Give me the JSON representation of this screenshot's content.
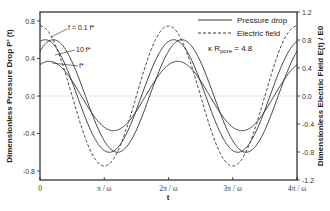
{
  "chart_data": {
    "type": "line",
    "title": "",
    "xlabel": "t",
    "ylabel": "Dimensionless Pressure Drop P' (t)",
    "y2label": "Dimensionless Electric Field E(t) / E0",
    "x_ticks": [
      "0",
      "π / ω",
      "2π / ω",
      "3π / ω",
      "4π / ω"
    ],
    "xlim": [
      0,
      4
    ],
    "x_unit": "π/ω",
    "ylim": [
      -0.9,
      0.9
    ],
    "y_ticks": [
      "0.8",
      "0.4",
      "0.0",
      "-0.4",
      "-0.8"
    ],
    "y2lim": [
      -1.2,
      1.2
    ],
    "y2_ticks": [
      "1.2",
      "0.8",
      "0.4",
      "0.0",
      "-0.4",
      "-0.8",
      "-1.2"
    ],
    "grid": false,
    "zero_line": "dotted",
    "legend_position": "upper right",
    "legend": [
      {
        "label": "Pressure drop",
        "style": "solid"
      },
      {
        "label": "Electric field",
        "style": "dashed"
      }
    ],
    "annotation_param": "κ Rpore = 4.8",
    "series": [
      {
        "name": "f = 0.1 f*",
        "axis": "left",
        "style": "solid",
        "amplitude": 0.6,
        "phase_lag_rad": 0.25,
        "x": [
          0,
          0.5,
          1,
          1.5,
          2,
          2.5,
          3,
          3.5,
          4
        ],
        "values": [
          0.58,
          -0.15,
          -0.58,
          0.15,
          0.58,
          -0.15,
          -0.58,
          0.15,
          0.58
        ]
      },
      {
        "name": "10 f*",
        "axis": "left",
        "style": "solid",
        "amplitude": 0.6,
        "phase_lag_rad": 0.65,
        "x": [
          0,
          0.5,
          1,
          1.5,
          2,
          2.5,
          3,
          3.5,
          4
        ],
        "values": [
          0.48,
          -0.36,
          -0.48,
          0.36,
          0.48,
          -0.36,
          -0.48,
          0.36,
          0.48
        ]
      },
      {
        "name": "f*",
        "axis": "left",
        "style": "solid",
        "amplitude": 0.37,
        "phase_lag_rad": 0.45,
        "x": [
          0,
          0.5,
          1,
          1.5,
          2,
          2.5,
          3,
          3.5,
          4
        ],
        "values": [
          0.33,
          -0.16,
          -0.33,
          0.16,
          0.33,
          -0.16,
          -0.33,
          0.16,
          0.33
        ]
      },
      {
        "name": "Electric field",
        "axis": "right",
        "style": "dashed",
        "amplitude": 1.0,
        "phase_lag_rad": 0.0,
        "x": [
          0,
          0.5,
          1,
          1.5,
          2,
          2.5,
          3,
          3.5,
          4
        ],
        "values": [
          1.0,
          0.0,
          -1.0,
          0.0,
          1.0,
          0.0,
          -1.0,
          0.0,
          1.0
        ]
      }
    ]
  },
  "labels": {
    "curve_01": "f = 0.1 f*",
    "curve_10": "10 f*",
    "curve_1": "f*",
    "kappa_prefix": "κ R",
    "kappa_sub": "pore",
    "kappa_suffix": " = 4.8"
  }
}
